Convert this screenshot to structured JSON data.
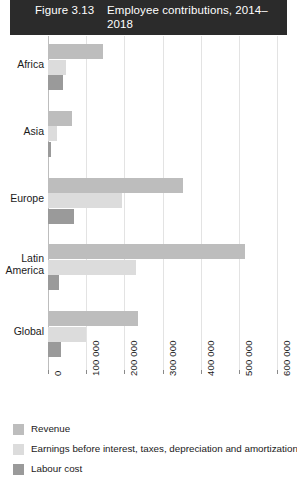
{
  "header": {
    "figure_number": "Figure 3.13",
    "title": "Employee contributions,\n2014–2018",
    "background_color": "#2b2b2b",
    "text_color": "#ffffff"
  },
  "legend": {
    "position": "bottom-left",
    "items": [
      {
        "label": "Revenue",
        "color": "#bdbdbd",
        "key": "revenue"
      },
      {
        "label": "Earnings before interest, taxes, depreciation and amortization",
        "color": "#dcdcdc",
        "key": "ebitda"
      },
      {
        "label": "Labour cost",
        "color": "#9a9a9a",
        "key": "labour"
      }
    ]
  },
  "chart_data": {
    "type": "bar",
    "orientation": "horizontal",
    "title": "Employee contributions, 2014–2018",
    "xlabel": "",
    "ylabel": "",
    "xlim": [
      0,
      600000
    ],
    "grid": true,
    "tick_labels": [
      "0",
      "100 000",
      "200 000",
      "300 000",
      "400 000",
      "500 000",
      "600 000"
    ],
    "tick_values": [
      0,
      100000,
      200000,
      300000,
      400000,
      500000,
      600000
    ],
    "categories": [
      "Africa",
      "Asia",
      "Europe",
      "Latin\nAmerica",
      "Global"
    ],
    "series": [
      {
        "name": "Revenue",
        "color": "#bdbdbd",
        "values": [
          143000,
          62000,
          355000,
          515000,
          235000
        ]
      },
      {
        "name": "Earnings before interest, taxes, depreciation and amortization",
        "color": "#dcdcdc",
        "values": [
          48000,
          23000,
          195000,
          230000,
          100000
        ]
      },
      {
        "name": "Labour cost",
        "color": "#9a9a9a",
        "values": [
          40000,
          9000,
          68000,
          30000,
          35000
        ]
      }
    ]
  }
}
